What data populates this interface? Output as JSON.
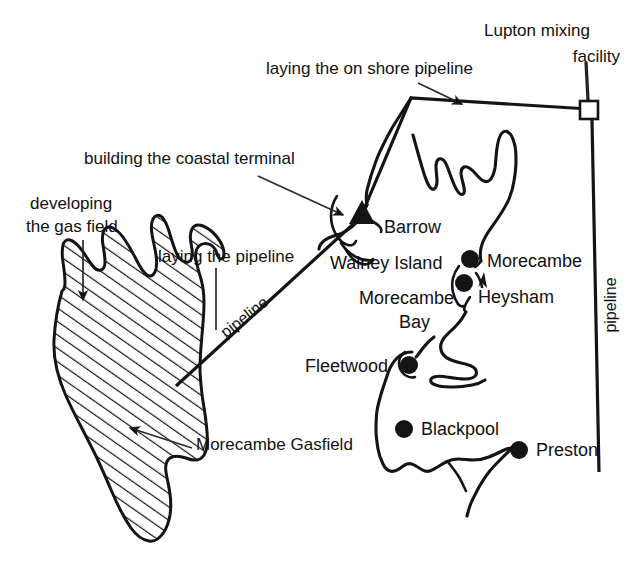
{
  "figure": {
    "type": "map",
    "region": "Morecambe Bay / Lancashire coast, United Kingdom",
    "background_color": "#ffffff",
    "ink_color": "#141414"
  },
  "annotations": [
    {
      "id": "developing-the-gas-field",
      "line1": "developing",
      "line2": "the gas field",
      "full": "developing the gas field",
      "x": 30,
      "y": 205,
      "points_to": "gasfield"
    },
    {
      "id": "building-the-coastal-terminal",
      "line1": "building the coastal terminal",
      "full": "building the coastal terminal",
      "x": 84,
      "y": 160,
      "points_to": "coastal-terminal"
    },
    {
      "id": "laying-the-on-shore-pipeline",
      "line1": "laying the on shore pipeline",
      "full": "laying the on shore pipeline",
      "x": 266,
      "y": 70,
      "points_to": "onshore-pipeline"
    },
    {
      "id": "laying-the-pipeline",
      "line1": "laying the pipeline",
      "full": "laying the pipeline",
      "x": 158,
      "y": 258,
      "points_to": "subsea-pipeline"
    },
    {
      "id": "lupton-mixing-facility",
      "line1": "Lupton mixing",
      "line2": "facility",
      "full": "Lupton mixing facility",
      "x": 484,
      "y": 32,
      "points_to": "lupton-facility"
    },
    {
      "id": "morecambe-gasfield",
      "line1": "Morecambe Gasfield",
      "full": "Morecambe Gasfield",
      "x": 196,
      "y": 445,
      "points_to": "gasfield"
    }
  ],
  "places": [
    {
      "id": "barrow",
      "label": "Barrow",
      "marker": "triangle",
      "label_x": 384,
      "label_y": 228,
      "marker_x": 362,
      "marker_y": 214
    },
    {
      "id": "walney-island",
      "label": "Walney Island",
      "marker": "none",
      "label_x": 330,
      "label_y": 264
    },
    {
      "id": "morecambe-bay",
      "label_line1": "Morecambe",
      "label_line2": "Bay",
      "label": "Morecambe Bay",
      "marker": "none",
      "label_x": 359,
      "label_y": 299
    },
    {
      "id": "morecambe",
      "label": "Morecambe",
      "marker": "dot",
      "label_x": 487,
      "label_y": 262,
      "marker_x": 470,
      "marker_y": 259
    },
    {
      "id": "heysham",
      "label": "Heysham",
      "marker": "dot",
      "label_x": 478,
      "label_y": 298,
      "marker_x": 464,
      "marker_y": 283
    },
    {
      "id": "fleetwood",
      "label": "Fleetwood",
      "marker": "dot",
      "label_x": 305,
      "label_y": 367,
      "marker_x": 409,
      "marker_y": 365
    },
    {
      "id": "blackpool",
      "label": "Blackpool",
      "marker": "dot",
      "label_x": 421,
      "label_y": 430,
      "marker_x": 404,
      "marker_y": 429
    },
    {
      "id": "preston",
      "label": "Preston",
      "marker": "dot",
      "label_x": 536,
      "label_y": 451,
      "marker_x": 519,
      "marker_y": 450
    }
  ],
  "pipeline_labels": [
    {
      "id": "subsea-pipeline-label",
      "text": "pipeline",
      "orientation": "diagonal",
      "x": 245,
      "y": 318,
      "rotation": -38
    },
    {
      "id": "onshore-pipeline-label",
      "text": "pipeline",
      "orientation": "vertical",
      "x": 612,
      "y": 305,
      "rotation": -90
    }
  ],
  "markers": {
    "coastal_terminal": {
      "id": "coastal-terminal",
      "shape": "triangle",
      "x": 362,
      "y": 214,
      "size": 13
    },
    "lupton_facility": {
      "id": "lupton-facility",
      "shape": "square",
      "x": 589,
      "y": 110,
      "size": 17
    }
  },
  "legend_note": ""
}
